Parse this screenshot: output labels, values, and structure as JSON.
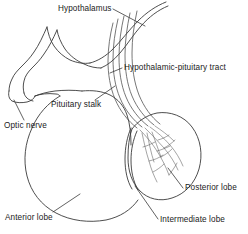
{
  "figure": {
    "background_color": "#ffffff",
    "line_color": "#3a3a3a",
    "text_color": "#1a1a1a",
    "width": 248,
    "height": 234
  },
  "labels": {
    "hypothalamus": "Hypothalamus",
    "tract": "Hypothalamic-pituitary tract",
    "stalk": "Pituitary stalk",
    "optic_nerve": "Optic nerve",
    "posterior_lobe": "Posterior lobe",
    "intermediate_lobe": "Intermediate lobe",
    "anterior_lobe": "Anterior lobe"
  }
}
